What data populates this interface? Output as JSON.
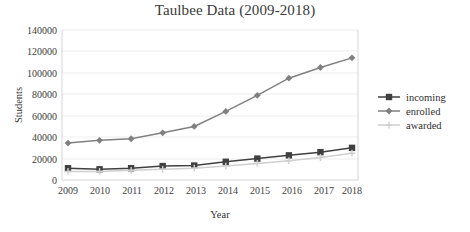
{
  "chart_data": {
    "type": "line",
    "title": "Taulbee Data (2009-2018)",
    "xlabel": "Year",
    "ylabel": "Students",
    "categories": [
      "2009",
      "2010",
      "2011",
      "2012",
      "2013",
      "2014",
      "2015",
      "2016",
      "2017",
      "2018"
    ],
    "x": [
      2009,
      2010,
      2011,
      2012,
      2013,
      2014,
      2015,
      2016,
      2017,
      2018
    ],
    "series": [
      {
        "name": "incoming",
        "marker": "square",
        "color": "#404040",
        "values": [
          11000,
          10000,
          11000,
          13000,
          13500,
          17000,
          20000,
          23000,
          26000,
          30000
        ]
      },
      {
        "name": "enrolled",
        "marker": "diamond",
        "color": "#808080",
        "values": [
          34500,
          37000,
          38500,
          44000,
          50000,
          64000,
          79000,
          95000,
          105000,
          114000
        ]
      },
      {
        "name": "awarded",
        "marker": "cross",
        "color": "#cfcfcf",
        "values": [
          8000,
          8000,
          9000,
          10000,
          11000,
          13000,
          15500,
          18000,
          21000,
          25000
        ]
      }
    ],
    "ylim": [
      0,
      140000
    ],
    "yticks": [
      0,
      20000,
      40000,
      60000,
      80000,
      100000,
      120000,
      140000
    ],
    "ytick_labels": [
      "0",
      "20000",
      "40000",
      "60000",
      "80000",
      "100000",
      "120000",
      "140000"
    ],
    "grid": true,
    "legend_position": "right",
    "legend_entries": [
      "incoming",
      "enrolled",
      "awarded"
    ]
  },
  "colors": {
    "incoming": "#404040",
    "enrolled": "#808080",
    "awarded": "#cfcfcf",
    "grid": "#e9e9e9",
    "text": "#333333",
    "background": "#ffffff"
  }
}
